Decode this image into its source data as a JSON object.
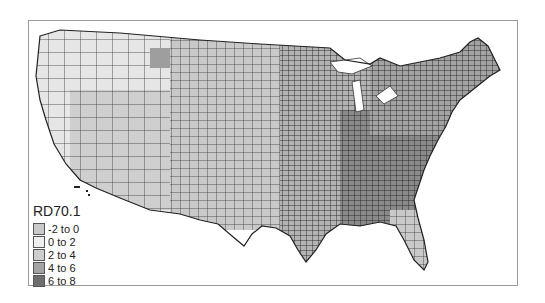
{
  "map": {
    "title": "RD70.1",
    "region": "Contiguous United States counties",
    "classes": [
      {
        "label": "-2 to 0",
        "color": "#c9c9c9"
      },
      {
        "label": "0 to 2",
        "color": "#efefef"
      },
      {
        "label": "2 to 4",
        "color": "#cdcdcd"
      },
      {
        "label": "4 to 6",
        "color": "#a3a3a3"
      },
      {
        "label": "6 to 8",
        "color": "#6e6e6e"
      }
    ]
  },
  "legend": {
    "title": "RD70.1",
    "items": [
      {
        "label": "-2 to 0"
      },
      {
        "label": "0 to 2"
      },
      {
        "label": "2 to 4"
      },
      {
        "label": "4 to 6"
      },
      {
        "label": "6 to 8"
      }
    ]
  }
}
